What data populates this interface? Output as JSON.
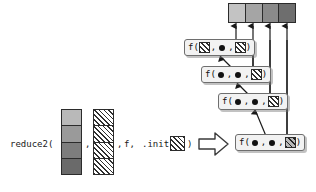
{
  "diagram": {
    "call_expression": {
      "prefix": "reduce2(",
      "sep1": ",",
      "sep2": ",",
      "fn_arg": "f,",
      "init_label": ".init =",
      "suffix": ")"
    },
    "input_arrays": [
      {
        "name": "gray-input-array",
        "cells": [
          "#b9b9b9",
          "#9a9a9a",
          "#7d7d7d",
          "#6a6a6a"
        ]
      },
      {
        "name": "hatched-input-array",
        "cells": [
          "hatch",
          "hatch",
          "hatch",
          "hatch"
        ]
      }
    ],
    "init_value": {
      "name": "init-swatch",
      "fill": "hatch"
    },
    "transform_arrow": {
      "name": "block-arrow-right",
      "glyph": "right-block-arrow"
    },
    "output_array": {
      "name": "output-array",
      "cells": [
        "#c3c3c3",
        "#a5a5a5",
        "#8a8a8a",
        "#6e6e6e"
      ]
    },
    "call_boxes": [
      {
        "id": "fbox-1",
        "label_f": "f(",
        "arg1": "swatch-hatch",
        "comma1": ",",
        "arg2": "dot",
        "comma2": ",",
        "arg3": "swatch-hatch",
        "close": ")"
      },
      {
        "id": "fbox-2",
        "label_f": "f(",
        "arg1": "dot",
        "comma1": ",",
        "arg2": "dot",
        "comma2": ",",
        "arg3": "swatch-hatch",
        "close": ")"
      },
      {
        "id": "fbox-3",
        "label_f": "f(",
        "arg1": "dot",
        "comma1": ",",
        "arg2": "dot",
        "comma2": ",",
        "arg3": "swatch-hatch",
        "close": ")"
      },
      {
        "id": "fbox-4",
        "label_f": "f(",
        "arg1": "dot",
        "comma1": ",",
        "arg2": "dot",
        "comma2": ",",
        "arg3": "swatch-hatch-dark",
        "close": ")"
      }
    ],
    "colors": {
      "stroke": "#2b2b2b",
      "box_fill": "#f2f2f2",
      "box_border": "#6e6e6e",
      "text": "#111111",
      "background": "#ffffff"
    }
  }
}
